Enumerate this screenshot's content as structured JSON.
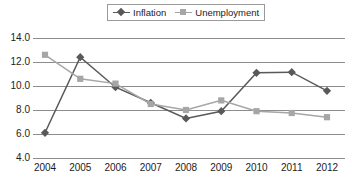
{
  "chart_data": {
    "type": "line",
    "title": "",
    "subtitle": "",
    "xlabel": "",
    "ylabel": "",
    "categories": [
      "2004",
      "2005",
      "2006",
      "2007",
      "2008",
      "2009",
      "2010",
      "2011",
      "2012"
    ],
    "series": [
      {
        "name": "Inflation",
        "marker": "diamond",
        "color": "#595959",
        "values": [
          6.1,
          12.4,
          9.9,
          8.6,
          7.3,
          7.9,
          11.1,
          11.15,
          9.6
        ]
      },
      {
        "name": "Unemployment",
        "marker": "square",
        "color": "#a6a6a6",
        "values": [
          12.6,
          10.6,
          10.2,
          8.5,
          8.0,
          8.8,
          7.9,
          7.75,
          7.4
        ]
      }
    ],
    "ylim": [
      4.0,
      14.0
    ],
    "yticks": [
      "4.0",
      "6.0",
      "8.0",
      "10.0",
      "12.0",
      "14.0"
    ],
    "ytick_values": [
      4.0,
      6.0,
      8.0,
      10.0,
      12.0,
      14.0
    ],
    "grid": "horizontal",
    "legend_position": "top-center",
    "legend_entries": [
      "Inflation",
      "Unemployment"
    ],
    "annotations": []
  },
  "colors": {
    "inflation": "#595959",
    "unemployment": "#a6a6a6",
    "gridline": "#8d8d8d",
    "text": "#1c1c1c",
    "legend_border": "#9a9a9a",
    "background": "#ffffff"
  }
}
